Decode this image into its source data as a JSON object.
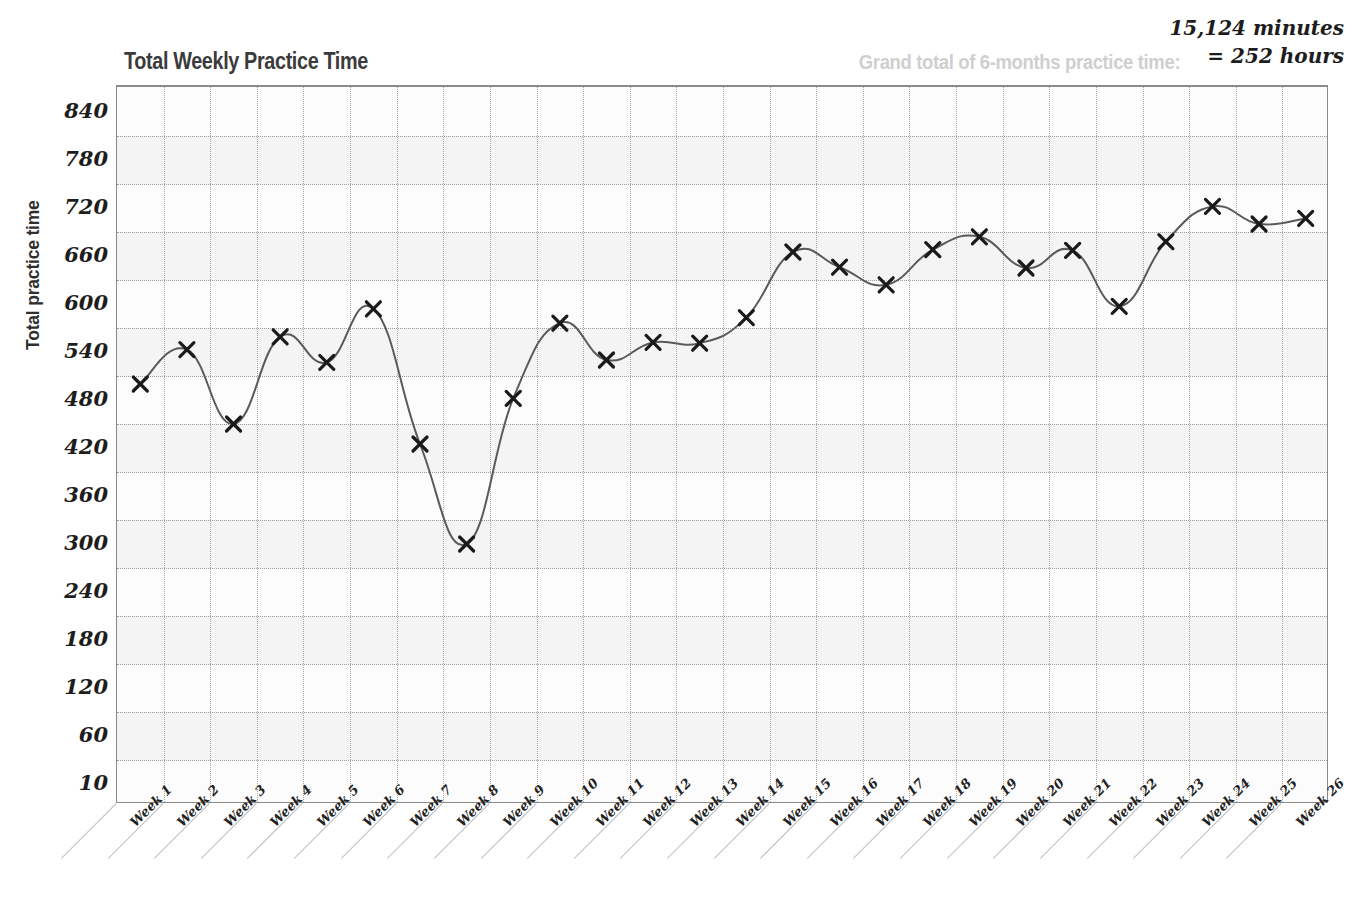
{
  "header": {
    "title": "Total Weekly Practice Time",
    "grand_total_label": "Grand total of 6-months practice time:",
    "grand_total_minutes": "15,124 minutes",
    "grand_total_hours": "= 252 hours"
  },
  "chart_data": {
    "type": "line",
    "title": "Total Weekly Practice Time",
    "xlabel": "",
    "ylabel": "Total practice time",
    "ylim": [
      10,
      870
    ],
    "grid": true,
    "legend": "none",
    "marker": "x",
    "line_color": "#5a5a5a",
    "marker_color": "#1a1a1a",
    "ytick_labels": [
      "840",
      "780",
      "720",
      "660",
      "600",
      "540",
      "480",
      "420",
      "360",
      "300",
      "240",
      "180",
      "120",
      "60",
      "10"
    ],
    "ytick_values": [
      840,
      780,
      720,
      660,
      600,
      540,
      480,
      420,
      360,
      300,
      240,
      180,
      120,
      60,
      10
    ],
    "categories": [
      "Week 1",
      "Week 2",
      "Week 3",
      "Week 4",
      "Week 5",
      "Week 6",
      "Week 7",
      "Week 8",
      "Week 9",
      "Week 10",
      "Week 11",
      "Week 12",
      "Week 13",
      "Week 14",
      "Week 15",
      "Week 16",
      "Week 17",
      "Week 18",
      "Week 19",
      "Week 20",
      "Week 21",
      "Week 22",
      "Week 23",
      "Week 24",
      "Week 25",
      "Week 26"
    ],
    "values": [
      500,
      543,
      450,
      559,
      527,
      594,
      425,
      300,
      482,
      576,
      530,
      552,
      551,
      583,
      665,
      646,
      624,
      668,
      684,
      645,
      667,
      597,
      678,
      722,
      700,
      707
    ],
    "series": [
      {
        "name": "Total practice time",
        "values": [
          500,
          543,
          450,
          559,
          527,
          594,
          425,
          300,
          482,
          576,
          530,
          552,
          551,
          583,
          665,
          646,
          624,
          668,
          684,
          645,
          667,
          597,
          678,
          722,
          700,
          707
        ]
      }
    ]
  }
}
